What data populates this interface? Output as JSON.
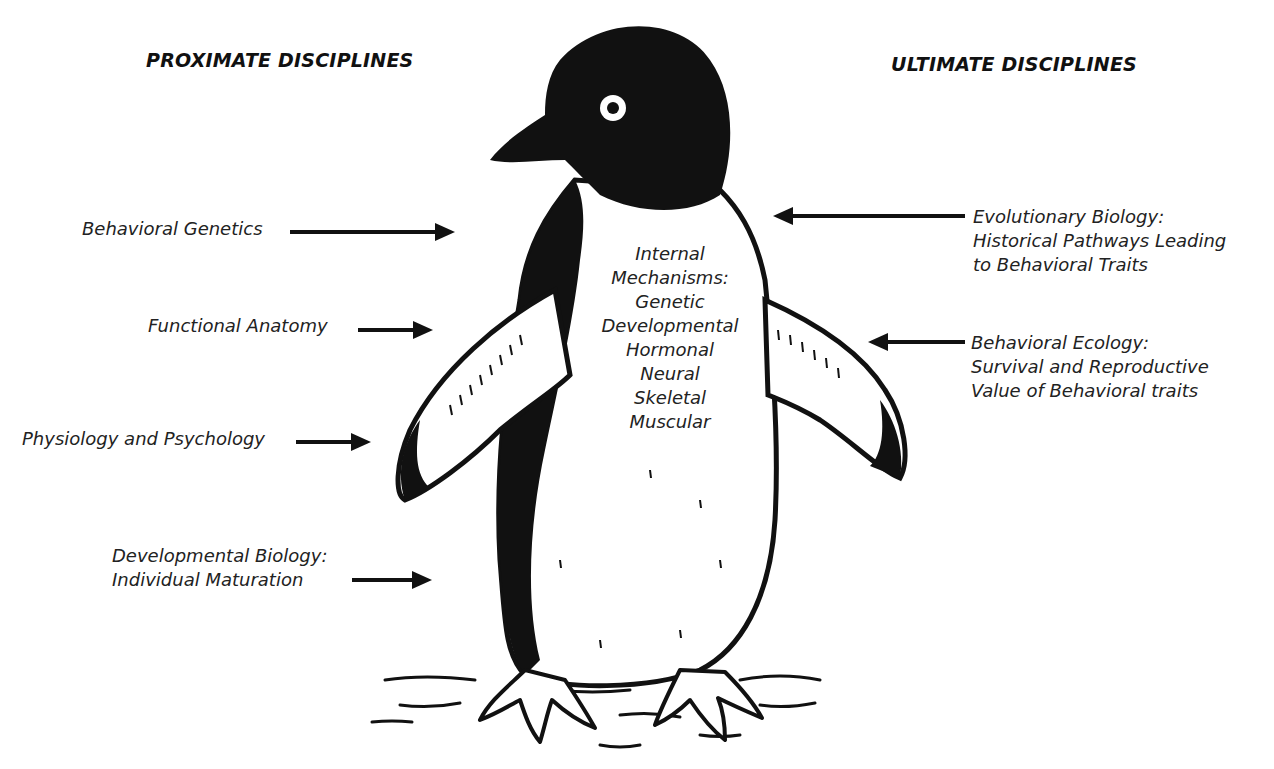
{
  "headers": {
    "proximate": "PROXIMATE DISCIPLINES",
    "ultimate": "ULTIMATE DISCIPLINES"
  },
  "proximate_labels": [
    {
      "lines": [
        "Behavioral Genetics"
      ]
    },
    {
      "lines": [
        "Functional Anatomy"
      ]
    },
    {
      "lines": [
        "Physiology and Psychology"
      ]
    },
    {
      "lines": [
        "Developmental Biology:",
        "Individual Maturation"
      ]
    }
  ],
  "ultimate_labels": [
    {
      "lines": [
        "Evolutionary Biology:",
        "Historical Pathways Leading",
        "to Behavioral Traits"
      ]
    },
    {
      "lines": [
        "Behavioral Ecology:",
        "Survival and Reproductive",
        "Value of Behavioral traits"
      ]
    }
  ],
  "center": {
    "lines": [
      "Internal",
      "Mechanisms:",
      "Genetic",
      "Developmental",
      "Hormonal",
      "Neural",
      "Skeletal",
      "Muscular"
    ]
  },
  "illustration": {
    "subject": "penguin",
    "ink_color": "#111111"
  }
}
